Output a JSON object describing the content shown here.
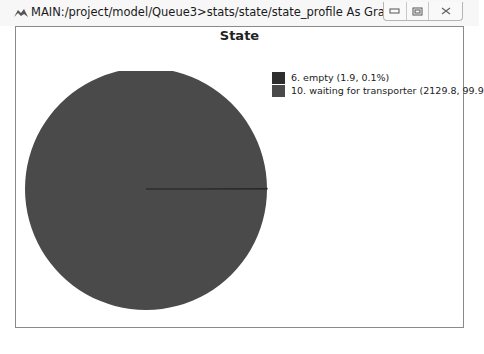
{
  "window": {
    "title": "MAIN:/project/model/Queue3>stats/state/state_profile As Graph",
    "controls": {
      "minimize": "minimize",
      "maximize": "maximize",
      "close": "close"
    }
  },
  "chart_data": {
    "type": "pie",
    "title": "State",
    "slices": [
      {
        "label": "6. empty (1.9, 0.1%)",
        "name": "6. empty",
        "value": 1.9,
        "percent": 0.1,
        "color": "#2e2e2e"
      },
      {
        "label": "10. waiting for transporter (2129.8, 99.9",
        "name": "10. waiting for transporter",
        "value": 2129.8,
        "percent": 99.9,
        "color": "#4a4a4a"
      }
    ],
    "legend_position": "right",
    "start_angle_deg": 0
  },
  "colors": {
    "slice_empty": "#2e2e2e",
    "slice_waiting": "#4a4a4a",
    "frame_border": "#8a8a8a"
  }
}
